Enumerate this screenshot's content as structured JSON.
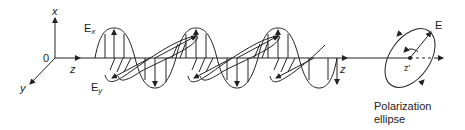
{
  "diagram": {
    "axes": {
      "origin": "0",
      "x": "x",
      "y": "y",
      "z": "z",
      "z_far": "z"
    },
    "field_components": {
      "ex_main": "E",
      "ex_sub": "x",
      "ey_main": "E",
      "ey_sub": "y"
    },
    "ellipse": {
      "vector_label": "E",
      "center_label": "z'",
      "caption_line1": "Polarization",
      "caption_line2": "ellipse"
    },
    "colors": {
      "stroke": "#222222",
      "background": "#ffffff"
    }
  }
}
